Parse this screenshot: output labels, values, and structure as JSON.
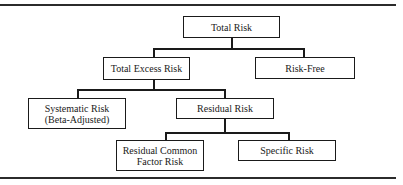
{
  "diagram": {
    "type": "tree",
    "nodes": {
      "total_risk": "Total Risk",
      "total_excess_risk": "Total Excess Risk",
      "risk_free": "Risk-Free",
      "systematic_risk_line1": "Systematic Risk",
      "systematic_risk_line2": "(Beta-Adjusted)",
      "residual_risk": "Residual Risk",
      "residual_common_factor_line1": "Residual Common",
      "residual_common_factor_line2": "Factor Risk",
      "specific_risk": "Specific Risk"
    },
    "edges": [
      [
        "Total Risk",
        "Total Excess Risk"
      ],
      [
        "Total Risk",
        "Risk-Free"
      ],
      [
        "Total Excess Risk",
        "Systematic Risk (Beta-Adjusted)"
      ],
      [
        "Total Excess Risk",
        "Residual Risk"
      ],
      [
        "Residual Risk",
        "Residual Common Factor Risk"
      ],
      [
        "Residual Risk",
        "Specific Risk"
      ]
    ]
  }
}
